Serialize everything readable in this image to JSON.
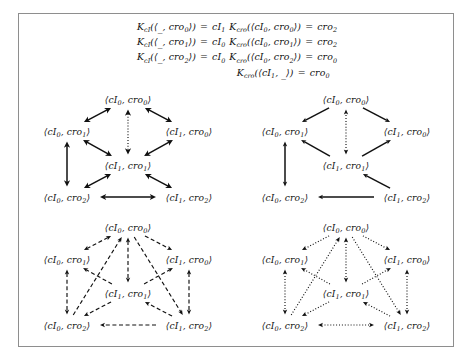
{
  "figure": {
    "frame_color": "#8e8e8e",
    "background": "#ffffff"
  },
  "equations": {
    "left": [
      {
        "fn": "K",
        "fn_sub": "cI",
        "arg_left": "_",
        "arg_right": "cro",
        "arg_right_sub": "0",
        "result": "cI",
        "result_sub": "1",
        "text": "K_cI(⟨_, cro_0⟩) = cI_1"
      },
      {
        "fn": "K",
        "fn_sub": "cI",
        "arg_left": "_",
        "arg_right": "cro",
        "arg_right_sub": "1",
        "result": "cI",
        "result_sub": "0",
        "text": "K_cI(⟨_, cro_1⟩) = cI_0"
      },
      {
        "fn": "K",
        "fn_sub": "cI",
        "arg_left": "_",
        "arg_right": "cro",
        "arg_right_sub": "2",
        "result": "cI",
        "result_sub": "0",
        "text": "K_cI(⟨_, cro_2⟩) = cI_0"
      }
    ],
    "right": [
      {
        "fn": "K",
        "fn_sub": "cro",
        "arg_left": "cI",
        "arg_left_sub": "0",
        "arg_right": "cro",
        "arg_right_sub": "0",
        "result": "cro",
        "result_sub": "2",
        "text": "K_cro(⟨cI_0, cro_0⟩) = cro_2"
      },
      {
        "fn": "K",
        "fn_sub": "cro",
        "arg_left": "cI",
        "arg_left_sub": "0",
        "arg_right": "cro",
        "arg_right_sub": "1",
        "result": "cro",
        "result_sub": "2",
        "text": "K_cro(⟨cI_0, cro_1⟩) = cro_2"
      },
      {
        "fn": "K",
        "fn_sub": "cro",
        "arg_left": "cI",
        "arg_left_sub": "0",
        "arg_right": "cro",
        "arg_right_sub": "2",
        "result": "cro",
        "result_sub": "0",
        "text": "K_cro(⟨cI_0, cro_2⟩) = cro_0"
      },
      {
        "fn": "K",
        "fn_sub": "cro",
        "arg_left": "cI",
        "arg_left_sub": "1",
        "arg_right": "_",
        "arg_right_sub": "",
        "result": "cro",
        "result_sub": "0",
        "text": "K_cro(⟨cI_1, _⟩) = cro_0"
      }
    ]
  },
  "diagrams": [
    {
      "id": "diagram-tl",
      "position": "top-left",
      "arrow_style": "solid",
      "arrow_head": "filled-barbed",
      "nodes": [
        {
          "id": "n00",
          "label_base": "cI",
          "label_sub": "0",
          "label2_base": "cro",
          "label2_sub": "0",
          "text": "⟨cI_0, cro_0⟩",
          "x": 109,
          "y": 13
        },
        {
          "id": "n01",
          "label_base": "cI",
          "label_sub": "0",
          "label2_base": "cro",
          "label2_sub": "1",
          "text": "⟨cI_0, cro_1⟩",
          "x": 48,
          "y": 45
        },
        {
          "id": "n10",
          "label_base": "cI",
          "label_sub": "1",
          "label2_base": "cro",
          "label2_sub": "0",
          "text": "⟨cI_1, cro_0⟩",
          "x": 170,
          "y": 45
        },
        {
          "id": "n11",
          "label_base": "cI",
          "label_sub": "1",
          "label2_base": "cro",
          "label2_sub": "1",
          "text": "⟨cI_1, cro_1⟩",
          "x": 109,
          "y": 79
        },
        {
          "id": "n02",
          "label_base": "cI",
          "label_sub": "0",
          "label2_base": "cro",
          "label2_sub": "2",
          "text": "⟨cI_0, cro_2⟩",
          "x": 48,
          "y": 111
        },
        {
          "id": "n12",
          "label_base": "cI",
          "label_sub": "1",
          "label2_base": "cro",
          "label2_sub": "2",
          "text": "⟨cI_1, cro_2⟩",
          "x": 170,
          "y": 111
        }
      ],
      "edges": [
        {
          "from": "n00",
          "to": "n01",
          "dir": "both",
          "line": "solid"
        },
        {
          "from": "n00",
          "to": "n10",
          "dir": "both",
          "line": "solid"
        },
        {
          "from": "n00",
          "to": "n11",
          "dir": "both",
          "line": "dotted"
        },
        {
          "from": "n01",
          "to": "n11",
          "dir": "both",
          "line": "solid"
        },
        {
          "from": "n10",
          "to": "n11",
          "dir": "both",
          "line": "solid"
        },
        {
          "from": "n01",
          "to": "n02",
          "dir": "both",
          "line": "solid"
        },
        {
          "from": "n11",
          "to": "n02",
          "dir": "both",
          "line": "solid"
        },
        {
          "from": "n11",
          "to": "n12",
          "dir": "both",
          "line": "solid"
        },
        {
          "from": "n02",
          "to": "n12",
          "dir": "both",
          "line": "solid"
        }
      ]
    },
    {
      "id": "diagram-tr",
      "position": "top-right",
      "arrow_style": "solid",
      "arrow_head": "open-thin",
      "nodes": [
        {
          "id": "n00",
          "text": "⟨cI_0, cro_0⟩",
          "x": 109,
          "y": 13
        },
        {
          "id": "n01",
          "text": "⟨cI_0, cro_1⟩",
          "x": 48,
          "y": 45
        },
        {
          "id": "n10",
          "text": "⟨cI_1, cro_0⟩",
          "x": 170,
          "y": 45
        },
        {
          "id": "n11",
          "text": "⟨cI_1, cro_1⟩",
          "x": 109,
          "y": 79
        },
        {
          "id": "n02",
          "text": "⟨cI_0, cro_2⟩",
          "x": 48,
          "y": 111
        },
        {
          "id": "n12",
          "text": "⟨cI_1, cro_2⟩",
          "x": 170,
          "y": 111
        }
      ],
      "edges": [
        {
          "from": "n00",
          "to": "n01",
          "dir": "forward",
          "line": "solid"
        },
        {
          "from": "n00",
          "to": "n10",
          "dir": "forward",
          "line": "solid"
        },
        {
          "from": "n11",
          "to": "n00",
          "dir": "both",
          "line": "dotted"
        },
        {
          "from": "n11",
          "to": "n01",
          "dir": "forward",
          "line": "solid"
        },
        {
          "from": "n11",
          "to": "n10",
          "dir": "forward",
          "line": "solid"
        },
        {
          "from": "n01",
          "to": "n02",
          "dir": "both",
          "line": "solid"
        },
        {
          "from": "n12",
          "to": "n11",
          "dir": "forward",
          "line": "solid"
        },
        {
          "from": "n12",
          "to": "n02",
          "dir": "forward",
          "line": "solid"
        }
      ]
    },
    {
      "id": "diagram-bl",
      "position": "bottom-left",
      "arrow_style": "dashed",
      "arrow_head": "open-thin",
      "nodes": [
        {
          "id": "n00",
          "text": "⟨cI_0, cro_0⟩",
          "x": 109,
          "y": 15
        },
        {
          "id": "n01",
          "text": "⟨cI_0, cro_1⟩",
          "x": 48,
          "y": 47
        },
        {
          "id": "n10",
          "text": "⟨cI_1, cro_0⟩",
          "x": 170,
          "y": 47
        },
        {
          "id": "n11",
          "text": "⟨cI_1, cro_1⟩",
          "x": 109,
          "y": 81
        },
        {
          "id": "n02",
          "text": "⟨cI_0, cro_2⟩",
          "x": 48,
          "y": 113
        },
        {
          "id": "n12",
          "text": "⟨cI_1, cro_2⟩",
          "x": 170,
          "y": 113
        }
      ],
      "edges": [
        {
          "from": "n00",
          "to": "n01",
          "dir": "both",
          "line": "dashed"
        },
        {
          "from": "n00",
          "to": "n10",
          "dir": "forward",
          "line": "dashed"
        },
        {
          "from": "n00",
          "to": "n11",
          "dir": "both",
          "line": "dashed"
        },
        {
          "from": "n11",
          "to": "n01",
          "dir": "forward",
          "line": "dashed"
        },
        {
          "from": "n11",
          "to": "n10",
          "dir": "forward",
          "line": "dashed"
        },
        {
          "from": "n01",
          "to": "n02",
          "dir": "both",
          "line": "dashed"
        },
        {
          "from": "n10",
          "to": "n12",
          "dir": "both",
          "line": "dashed"
        },
        {
          "from": "n02",
          "to": "n00",
          "dir": "forward",
          "line": "dashed"
        },
        {
          "from": "n00",
          "to": "n12",
          "dir": "forward",
          "line": "dashed"
        },
        {
          "from": "n11",
          "to": "n02",
          "dir": "forward",
          "line": "dashed"
        },
        {
          "from": "n12",
          "to": "n11",
          "dir": "forward",
          "line": "dashed"
        },
        {
          "from": "n12",
          "to": "n02",
          "dir": "forward",
          "line": "dashed"
        }
      ]
    },
    {
      "id": "diagram-br",
      "position": "bottom-right",
      "arrow_style": "dotted",
      "arrow_head": "open-thin",
      "nodes": [
        {
          "id": "n00",
          "text": "⟨cI_0, cro_0⟩",
          "x": 109,
          "y": 15
        },
        {
          "id": "n01",
          "text": "⟨cI_0, cro_1⟩",
          "x": 48,
          "y": 47
        },
        {
          "id": "n10",
          "text": "⟨cI_1, cro_0⟩",
          "x": 170,
          "y": 47
        },
        {
          "id": "n11",
          "text": "⟨cI_1, cro_1⟩",
          "x": 109,
          "y": 81
        },
        {
          "id": "n02",
          "text": "⟨cI_0, cro_2⟩",
          "x": 48,
          "y": 113
        },
        {
          "id": "n12",
          "text": "⟨cI_1, cro_2⟩",
          "x": 170,
          "y": 113
        }
      ],
      "edges": [
        {
          "from": "n00",
          "to": "n01",
          "dir": "forward",
          "line": "dotted"
        },
        {
          "from": "n00",
          "to": "n10",
          "dir": "forward",
          "line": "dotted"
        },
        {
          "from": "n00",
          "to": "n11",
          "dir": "both",
          "line": "dotted"
        },
        {
          "from": "n11",
          "to": "n01",
          "dir": "forward",
          "line": "dotted"
        },
        {
          "from": "n11",
          "to": "n10",
          "dir": "forward",
          "line": "dotted"
        },
        {
          "from": "n01",
          "to": "n02",
          "dir": "both",
          "line": "dotted"
        },
        {
          "from": "n10",
          "to": "n12",
          "dir": "both",
          "line": "dotted"
        },
        {
          "from": "n02",
          "to": "n00",
          "dir": "forward",
          "line": "dotted"
        },
        {
          "from": "n00",
          "to": "n12",
          "dir": "forward",
          "line": "dotted"
        },
        {
          "from": "n11",
          "to": "n02",
          "dir": "forward",
          "line": "dotted"
        },
        {
          "from": "n12",
          "to": "n11",
          "dir": "forward",
          "line": "dotted"
        },
        {
          "from": "n02",
          "to": "n12",
          "dir": "both",
          "line": "dotted"
        }
      ]
    }
  ]
}
